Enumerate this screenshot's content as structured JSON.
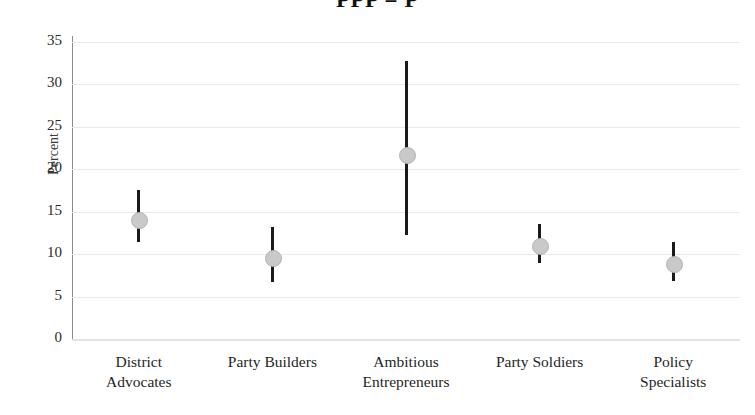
{
  "chart_data": {
    "type": "scatter",
    "title": "PPP = P",
    "xlabel": "",
    "ylabel": "Percent",
    "ylim": [
      0,
      35
    ],
    "yticks": [
      0,
      5,
      10,
      15,
      20,
      25,
      30,
      35
    ],
    "ytick_labels": [
      "0",
      "5",
      "10",
      "15",
      "20",
      "25",
      "30",
      "35"
    ],
    "grid": true,
    "legend": "none",
    "categories": [
      "District Advocates",
      "Party Builders",
      "Ambitious Entrepreneurs",
      "Party Soldiers",
      "Policy Specialists"
    ],
    "category_lines": [
      [
        "District",
        "Advocates"
      ],
      [
        "Party Builders",
        ""
      ],
      [
        "Ambitious",
        "Entrepreneurs"
      ],
      [
        "Party Soldiers",
        ""
      ],
      [
        "Policy",
        "Specialists"
      ]
    ],
    "series": [
      {
        "name": "Percent",
        "values": [
          14.1,
          9.6,
          21.7,
          11.0,
          8.9
        ],
        "ci_low": [
          11.4,
          6.7,
          12.3,
          9.0,
          6.8
        ],
        "ci_high": [
          17.6,
          13.2,
          32.8,
          13.5,
          11.4
        ]
      }
    ],
    "marker_color": "#c9c9c9",
    "line_color": "#1a1a1a",
    "grid_color": "#e9e9ea"
  }
}
